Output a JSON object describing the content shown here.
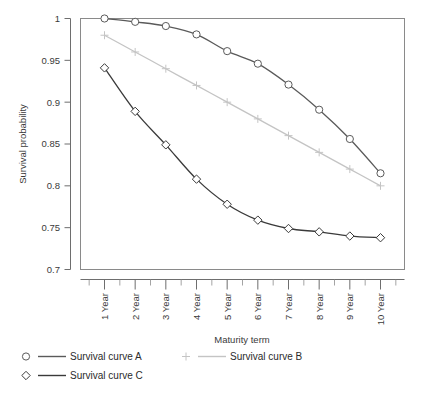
{
  "chart_data": {
    "type": "line",
    "title": "",
    "xlabel": "Maturity term",
    "ylabel": "Survival probability",
    "categories": [
      "1 Year",
      "2 Year",
      "3 Year",
      "4 Year",
      "5 Year",
      "6 Year",
      "7 Year",
      "8 Year",
      "9 Year",
      "10 Year"
    ],
    "ylim": [
      0.7,
      1.0
    ],
    "yticks": [
      0.7,
      0.75,
      0.8,
      0.85,
      0.9,
      0.95,
      1
    ],
    "ytick_labels": [
      "0.7",
      "0.75",
      "0.8",
      "0.85",
      "0.9",
      "0.95",
      "1"
    ],
    "grid": false,
    "legend_position": "bottom",
    "series": [
      {
        "name": "Survival curve A",
        "marker": "circle",
        "color": "#5a5a5a",
        "values": [
          1.0,
          0.996,
          0.991,
          0.981,
          0.961,
          0.946,
          0.921,
          0.891,
          0.856,
          0.815
        ]
      },
      {
        "name": "Survival curve B",
        "marker": "plus",
        "color": "#c4c4c4",
        "values": [
          0.98,
          0.96,
          0.94,
          0.92,
          0.9,
          0.88,
          0.86,
          0.84,
          0.82,
          0.8
        ]
      },
      {
        "name": "Survival curve C",
        "marker": "diamond",
        "color": "#3a3a3a",
        "values": [
          0.941,
          0.889,
          0.849,
          0.808,
          0.778,
          0.759,
          0.749,
          0.745,
          0.74,
          0.738
        ]
      }
    ]
  },
  "legend": {
    "entries": [
      {
        "label": "Survival curve A",
        "marker": "circle-marker",
        "color": "#5a5a5a"
      },
      {
        "label": "Survival curve B",
        "marker": "plus-marker",
        "color": "#c4c4c4"
      },
      {
        "label": "Survival curve C",
        "marker": "diamond-marker",
        "color": "#3a3a3a"
      }
    ]
  }
}
